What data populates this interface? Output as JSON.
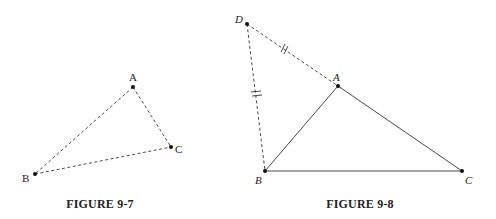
{
  "figures": [
    {
      "caption": "FIGURE 9-7",
      "points": {
        "A": [
          133,
          87
        ],
        "B": [
          35,
          174
        ],
        "C": [
          171,
          147
        ]
      },
      "labels": {
        "A": "A",
        "B": "B",
        "C": "C"
      },
      "segments": [
        {
          "from": "A",
          "to": "B",
          "style": "dashed"
        },
        {
          "from": "A",
          "to": "C",
          "style": "dashed"
        },
        {
          "from": "B",
          "to": "C",
          "style": "dashed"
        }
      ]
    },
    {
      "caption": "FIGURE 9-8",
      "points": {
        "D": [
          247,
          24
        ],
        "A": [
          338,
          86
        ],
        "B": [
          265,
          171
        ],
        "C": [
          462,
          171
        ]
      },
      "labels": {
        "D": "D",
        "A": "A",
        "B": "B",
        "C": "C"
      },
      "segments": [
        {
          "from": "A",
          "to": "B",
          "style": "solid"
        },
        {
          "from": "A",
          "to": "C",
          "style": "solid"
        },
        {
          "from": "B",
          "to": "C",
          "style": "solid"
        },
        {
          "from": "D",
          "to": "A",
          "style": "dashed",
          "tick_marks": 2
        },
        {
          "from": "D",
          "to": "B",
          "style": "dashed",
          "tick_marks": 2
        }
      ]
    }
  ],
  "colors": {
    "line": "#333333",
    "background": "#ffffff"
  }
}
